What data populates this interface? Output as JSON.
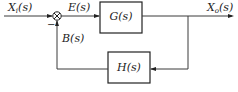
{
  "diagram": {
    "type": "negative-feedback-block-diagram",
    "input": {
      "symbol": "X",
      "subscript": "i",
      "arg": "(s)"
    },
    "output": {
      "symbol": "X",
      "subscript": "o",
      "arg": "(s)"
    },
    "error_signal": "E(s)",
    "feedback_signal": "B(s)",
    "forward_block": "G(s)",
    "feedback_block": "H(s)",
    "summing_junction": {
      "feedback_sign": "−"
    },
    "colors": {
      "line": "#3a3a3a",
      "box_border": "#222222",
      "text": "#222222",
      "background": "#ffffff"
    }
  }
}
